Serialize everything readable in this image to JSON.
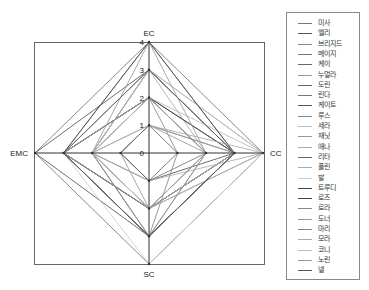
{
  "chart_data": {
    "type": "radar",
    "title": "",
    "axes": [
      "EC",
      "CC",
      "SC",
      "EMC"
    ],
    "axis_positions": {
      "EC": "top",
      "CC": "right",
      "SC": "bottom",
      "EMC": "left"
    },
    "radial_ticks": [
      0,
      1,
      2,
      3,
      4
    ],
    "rlim": [
      0,
      4
    ],
    "grid": false,
    "legend_position": "right",
    "series": [
      {
        "name": "미사",
        "values": {
          "EC": 4,
          "CC": 4,
          "SC": 4,
          "EMC": 4
        },
        "color": "#777777"
      },
      {
        "name": "엘리",
        "values": {
          "EC": 3,
          "CC": 3,
          "SC": 3,
          "EMC": 4
        },
        "color": "#555555"
      },
      {
        "name": "브리지드",
        "values": {
          "EC": 4,
          "CC": 3,
          "SC": 3,
          "EMC": 3
        },
        "color": "#888888"
      },
      {
        "name": "메이지",
        "values": {
          "EC": 3,
          "CC": 4,
          "SC": 2,
          "EMC": 3
        },
        "color": "#777777"
      },
      {
        "name": "케이",
        "values": {
          "EC": 2,
          "CC": 3,
          "SC": 2,
          "EMC": 3
        },
        "color": "#666666"
      },
      {
        "name": "누얼라",
        "values": {
          "EC": 2,
          "CC": 3,
          "SC": 3,
          "EMC": 2
        },
        "color": "#999999"
      },
      {
        "name": "도린",
        "values": {
          "EC": 3,
          "CC": 3,
          "SC": 2,
          "EMC": 2
        },
        "color": "#666666"
      },
      {
        "name": "린다",
        "values": {
          "EC": 2,
          "CC": 2,
          "SC": 1,
          "EMC": 2
        },
        "color": "#777777"
      },
      {
        "name": "케이트",
        "values": {
          "EC": 1,
          "CC": 3,
          "SC": 1,
          "EMC": 1
        },
        "color": "#555555"
      },
      {
        "name": "루스",
        "values": {
          "EC": 2,
          "CC": 1,
          "SC": 3,
          "EMC": 3
        },
        "color": "#888888"
      },
      {
        "name": "세라",
        "values": {
          "EC": 2,
          "CC": 4,
          "SC": 2,
          "EMC": 2
        },
        "color": "#bbbbbb"
      },
      {
        "name": "재닛",
        "values": {
          "EC": 1,
          "CC": 2,
          "SC": 2,
          "EMC": 1
        },
        "color": "#999999"
      },
      {
        "name": "애나",
        "values": {
          "EC": 3,
          "CC": 2,
          "SC": 3,
          "EMC": 2
        },
        "color": "#aaaaaa"
      },
      {
        "name": "리타",
        "values": {
          "EC": 1,
          "CC": 1,
          "SC": 1,
          "EMC": 1
        },
        "color": "#666666"
      },
      {
        "name": "폴린",
        "values": {
          "EC": 1,
          "CC": 3,
          "SC": 2,
          "EMC": 2
        },
        "color": "#aaaaaa"
      },
      {
        "name": "발",
        "values": {
          "EC": 3,
          "CC": 4,
          "SC": 4,
          "EMC": 3
        },
        "color": "#cccccc"
      },
      {
        "name": "트루디",
        "values": {
          "EC": 2,
          "CC": 3,
          "SC": 3,
          "EMC": 3
        },
        "color": "#444444"
      },
      {
        "name": "로즈",
        "values": {
          "EC": 4,
          "CC": 3,
          "SC": 2,
          "EMC": 3
        },
        "color": "#444444"
      },
      {
        "name": "로라",
        "values": {
          "EC": 3,
          "CC": 3,
          "SC": 3,
          "EMC": 2
        },
        "color": "#888888"
      },
      {
        "name": "도너",
        "values": {
          "EC": 4,
          "CC": 2,
          "SC": 2,
          "EMC": 2
        },
        "color": "#999999"
      },
      {
        "name": "마리",
        "values": {
          "EC": 2,
          "CC": 2,
          "SC": 3,
          "EMC": 3
        },
        "color": "#888888"
      },
      {
        "name": "모라",
        "values": {
          "EC": 1,
          "CC": 4,
          "SC": 1,
          "EMC": 2
        },
        "color": "#aaaaaa"
      },
      {
        "name": "코니",
        "values": {
          "EC": 3,
          "CC": 3,
          "SC": 2,
          "EMC": 2
        },
        "color": "#bbbbbb"
      },
      {
        "name": "노린",
        "values": {
          "EC": 2,
          "CC": 2,
          "SC": 2,
          "EMC": 3
        },
        "color": "#999999"
      },
      {
        "name": "넬",
        "values": {
          "EC": 3,
          "CC": 3,
          "SC": 3,
          "EMC": 3
        },
        "color": "#555555"
      }
    ]
  },
  "labels": {
    "ec": "EC",
    "cc": "CC",
    "sc": "SC",
    "emc": "EMC",
    "ticks": [
      "0",
      "1",
      "2",
      "3",
      "4"
    ]
  },
  "legend": {
    "items": [
      "미사",
      "엘리",
      "브리지드",
      "메이지",
      "케이",
      "누얼라",
      "도린",
      "린다",
      "케이트",
      "루스",
      "세라",
      "재닛",
      "애나",
      "리타",
      "폴린",
      "발",
      "트루디",
      "로즈",
      "로라",
      "도너",
      "마리",
      "모라",
      "코니",
      "노린",
      "넬"
    ]
  }
}
